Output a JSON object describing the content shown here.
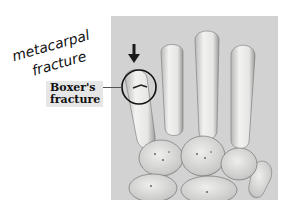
{
  "annotation": {
    "handwritten_line1": "metacarpal",
    "handwritten_line2": "fracture"
  },
  "label": {
    "line1": "Boxer's",
    "line2": "fracture"
  },
  "colors": {
    "photo_background": "#d2d2d2",
    "bone": "#f0f0ee",
    "label_background": "#e6e6e6",
    "ink": "#111111"
  }
}
